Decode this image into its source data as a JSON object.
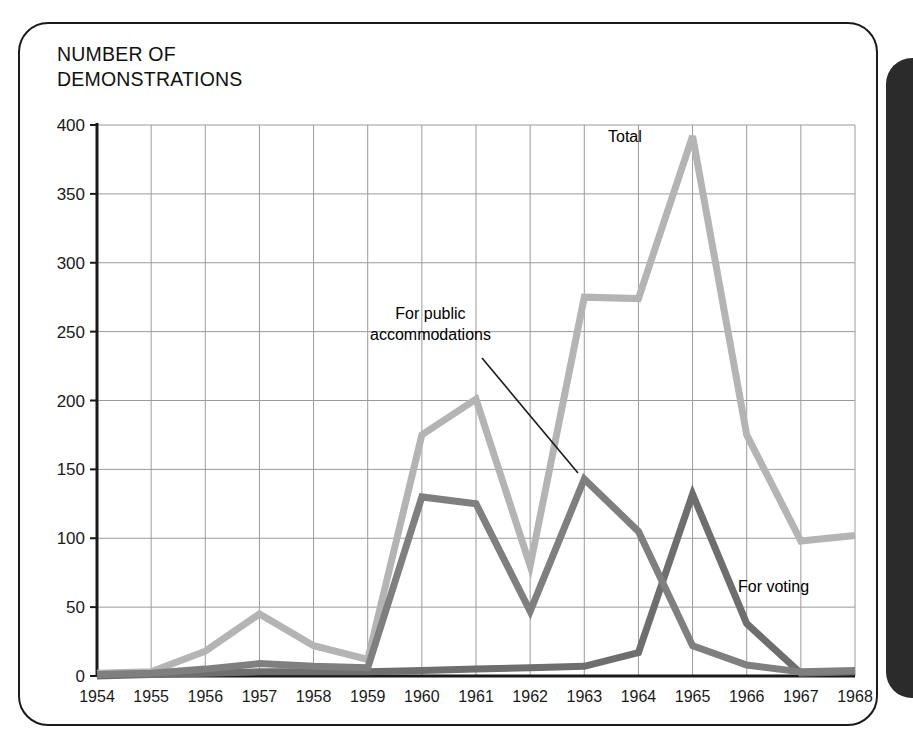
{
  "figure": {
    "title": "NUMBER OF\nDEMONSTRATIONS",
    "panel_color": "#2b2b2b",
    "border_color": "#1b1b1b",
    "grid_color": "#9a9a9a",
    "axis_color": "#1a1a1a"
  },
  "annotations": {
    "total": "Total",
    "public_accommodations": "For public\naccommodations",
    "voting": "For voting"
  },
  "chart_data": {
    "type": "line",
    "title": "NUMBER OF DEMONSTRATIONS",
    "xlabel": "",
    "ylabel": "NUMBER OF DEMONSTRATIONS",
    "categories": [
      "1954",
      "1955",
      "1956",
      "1957",
      "1958",
      "1959",
      "1960",
      "1961",
      "1962",
      "1963",
      "1964",
      "1965",
      "1966",
      "1967",
      "1968"
    ],
    "x": [
      1954,
      1955,
      1956,
      1957,
      1958,
      1959,
      1960,
      1961,
      1962,
      1963,
      1964,
      1965,
      1966,
      1967,
      1968
    ],
    "ylim": [
      0,
      400
    ],
    "xlim": [
      1954,
      1968
    ],
    "yticks": [
      0,
      50,
      100,
      150,
      200,
      250,
      300,
      350,
      400
    ],
    "grid": true,
    "legend_position": "inline-annotations",
    "series": [
      {
        "name": "Total",
        "color": "#b4b4b4",
        "values": [
          2,
          3,
          18,
          45,
          22,
          12,
          175,
          201,
          80,
          275,
          274,
          392,
          175,
          98,
          102
        ]
      },
      {
        "name": "For public accommodations",
        "color": "#7f7f7f",
        "values": [
          1,
          2,
          5,
          9,
          7,
          6,
          130,
          125,
          47,
          143,
          105,
          22,
          8,
          3,
          4
        ]
      },
      {
        "name": "For voting",
        "color": "#6e6e6e",
        "values": [
          0,
          1,
          2,
          3,
          3,
          3,
          4,
          5,
          6,
          7,
          17,
          132,
          38,
          2,
          3
        ]
      }
    ]
  }
}
